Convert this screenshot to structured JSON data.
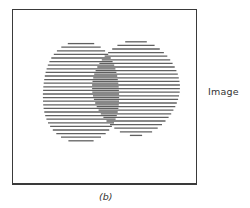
{
  "figure": {
    "side_label": "Image",
    "caption": "(b)",
    "colors": {
      "frame": "#3a3a3a",
      "lines": "#444444",
      "background": "#ffffff",
      "text": "#333333"
    },
    "regions": [
      {
        "name": "left-ellipse"
      },
      {
        "name": "right-ellipse"
      }
    ]
  }
}
